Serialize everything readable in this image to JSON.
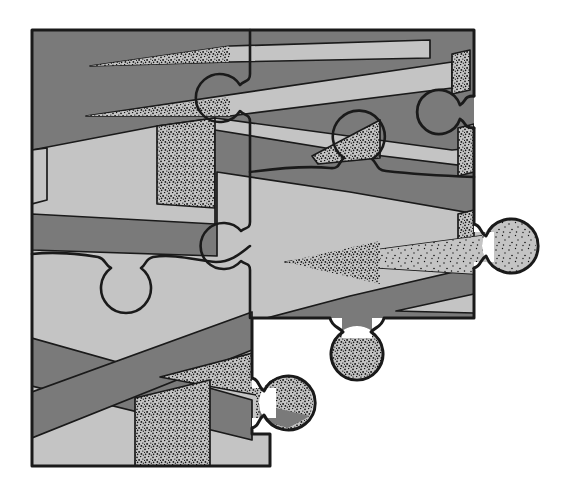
{
  "artwork": {
    "type": "illustration",
    "description": "Partially assembled jigsaw puzzle covered by a zigzag ribbon pattern in two grays with stippled shading; lower-right pieces missing, one socket opening on the right edge, three protruding knobs",
    "canvas": {
      "width": 566,
      "height": 496
    },
    "palette": {
      "background": "#ffffff",
      "ribbon_light": "#c4c4c4",
      "ribbon_dark": "#7a7a7a",
      "outline": "#1a1a1a",
      "stipple": "#111111"
    },
    "features": {
      "protruding_knobs": 3,
      "socket_openings": 1,
      "vertical_seams": 1,
      "horizontal_seams": 2
    },
    "paths": {
      "clipMain": "M32,30 H474 V318 H252 V434 H270 V466 H32 Z",
      "clipK1": "M468,232 H494 V262 H468 Z M536,246 A27,27 0 1 0 482,246 A27,27 0 1 0 536,246 Z",
      "clipK2": "M342,312 H372 V338 H342 Z M383,352 A26,26 0 1 0 331,352 A26,26 0 1 0 383,352 Z",
      "clipK3": "M252,388 H276 V418 H252 Z M313,403 A27,27 0 1 0 259,403 A27,27 0 1 0 313,403 Z",
      "band_top": "M32,30 L540,30 L540,142 L452,150 L215,118 L157,126 L32,150 Z",
      "wedge1": "M90,66 L230,46 L430,40 L430,58 L230,62 Z",
      "wedge1_stipple": "M90,66 L230,46 L230,62 Z",
      "wedge2": "M86,116 L452,62 L452,88 L230,116 Z",
      "wedge2_stipple": "M86,116 L230,97 L230,116 Z",
      "face_right_top": "M452,54 L470,50 L470,90 L452,94 Z",
      "face_center_left": "M157,126 L215,118 L215,208 L157,204 Z",
      "face_left_edge": "M32,150 L47,148 L47,200 L32,204 Z",
      "band_middle": "M32,214 L215,224 L215,130 L350,152 L540,175 L540,225 L350,192 L217,172 L217,256 L32,250 Z",
      "stipple_knob_up": "M312,156 L380,120 L380,158 L318,164 Z",
      "face_right_mid1": "M458,128 L474,124 L474,172 L458,176 Z",
      "face_right_mid2": "M458,214 L474,210 L474,272 L458,276 Z",
      "band_bottom_right": "M252,322 L350,296 L540,252 L540,318 L252,345 Z",
      "wedge3": "M285,262 L540,228 L540,278 Z",
      "wedge3_stipple": "M285,262 L380,241 L380,284 Z",
      "wedge4": "M396,311 L474,294 L474,313 Z",
      "knob1_stipple": "M482,219 H536 V273 H482 Z",
      "knob2_stipple": "M331,336 H383 V378 H331 Z",
      "band_x_down": "M32,338 L252,400 L252,440 L32,386 Z",
      "band_x_up": "M32,392 L252,312 L252,350 L32,438 Z",
      "stipple_wedge_low": "M160,377 L272,348 L272,398 Z",
      "face_bottom": "M135,398 L210,380 L210,466 L135,466 Z",
      "knob3_stipple": "M256,376 H313 V430 H256 Z",
      "knob3_dark": "M259,404 L310,416 L288,428 L260,420 Z",
      "socket": "M474,96 C463,96 467,101 460,105 A22,22 0 1 0 460,119 C467,123 463,128 474,128",
      "seam_vertical": "M250,30 L250,74 C250,82 245,80 240,85 A24,24 0 1 0 240,111 C245,116 250,114 250,122 L250,222 C250,229 246,227 241,231 A23,23 0 1 0 241,261 C246,265 250,263 250,270 L250,318",
      "seam_left": "M32,254 C58,251 80,254 98,257 C106,259 104,264 111,268 A25,25 0 1 0 141,268 C147,264 145,259 153,257 C176,253 202,262 216,262 C232,262 242,252 250,246",
      "seam_right": "M250,172 C280,168 310,166 330,168 C340,169 338,163 344,158 A26,26 0 1 1 372,159 C378,164 376,170 386,171 C412,174 448,176 474,177",
      "outline": "M474,96 L474,30 L32,30 L32,466 L270,466 L270,434 L252,434 L252,428 C260,426 257,420 264,415 A27,27 0 1 0 264,391 C257,386 260,380 252,378 L252,318 L330,318 C332,327 339,327 343,332 A26,26 0 1 0 371,332 C375,327 382,327 384,318 L474,318 L474,268 C482,266 479,260 486,256 A27,27 0 1 0 486,236 C479,232 482,226 474,224 L474,128"
    }
  }
}
